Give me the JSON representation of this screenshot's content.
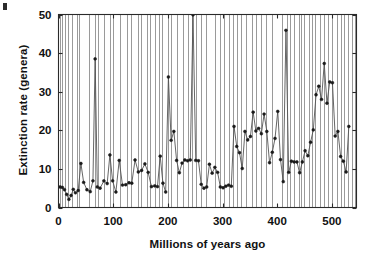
{
  "figure": {
    "ylabel": "Extinction rate (genera)",
    "xlabel": "Millions of years ago"
  },
  "chart_data": {
    "type": "line",
    "title": "",
    "xlabel": "Millions of years ago",
    "ylabel": "Extinction rate (genera)",
    "xlim": [
      0,
      545
    ],
    "ylim": [
      0,
      50
    ],
    "xticks": [
      0,
      100,
      200,
      300,
      400,
      500
    ],
    "xticklabels": [
      "0",
      "100",
      "200",
      "300",
      "400",
      "500"
    ],
    "yticks": [
      0,
      10,
      20,
      30,
      40,
      50
    ],
    "yticklabels": [
      "0",
      "10",
      "20",
      "30",
      "40",
      "50"
    ],
    "grid": "vertical-only",
    "grid_color": "#9a9a9a",
    "legend": "none",
    "marker": "dot",
    "marker_color": "#1a1a1a",
    "line_color": "#555555",
    "frame_color": "#2a2a2a",
    "x_increases_leftward": false,
    "note_offscale": "Permian-Triassic peak near 251 Ma extends to/through the top of the axis",
    "gridlines_x": [
      2,
      6,
      12,
      17,
      24,
      34,
      38,
      55,
      66,
      72,
      84,
      94,
      100,
      112,
      125,
      132,
      145,
      151,
      162,
      168,
      176,
      183,
      190,
      200,
      206,
      216,
      228,
      237,
      245,
      251,
      260,
      270,
      286,
      296,
      303,
      311,
      320,
      327,
      333,
      342,
      354,
      362,
      370,
      380,
      391,
      409,
      417,
      424,
      430,
      439,
      443,
      449,
      458,
      464,
      470,
      478,
      485,
      492,
      501,
      510,
      517,
      523,
      530,
      536,
      543
    ],
    "x": [
      3,
      7,
      11,
      15,
      19,
      23,
      27,
      31,
      36,
      41,
      46,
      52,
      58,
      63,
      67,
      71,
      76,
      83,
      89,
      94,
      99,
      105,
      111,
      117,
      123,
      129,
      134,
      140,
      146,
      152,
      158,
      164,
      170,
      176,
      181,
      186,
      191,
      196,
      201,
      206,
      211,
      216,
      221,
      226,
      231,
      236,
      241,
      246,
      251,
      256,
      261,
      266,
      271,
      276,
      281,
      286,
      291,
      296,
      301,
      306,
      311,
      316,
      321,
      326,
      331,
      336,
      341,
      346,
      351,
      356,
      361,
      366,
      371,
      376,
      381,
      386,
      391,
      396,
      401,
      406,
      411,
      416,
      421,
      426,
      431,
      436,
      441,
      446,
      451,
      456,
      461,
      466,
      471,
      476,
      481,
      486,
      491,
      496,
      501,
      506,
      511,
      516,
      521,
      526,
      531,
      536,
      541
    ],
    "y": [
      5.3,
      5.2,
      4.6,
      3.4,
      2.1,
      3.1,
      4.7,
      3.8,
      4.4,
      11.4,
      6.5,
      4.6,
      4.1,
      6.9,
      38.5,
      5.3,
      5.0,
      6.9,
      6.2,
      13.6,
      6.9,
      4.0,
      12.2,
      5.8,
      5.9,
      6.4,
      6.3,
      12.3,
      9.2,
      9.6,
      11.3,
      9.1,
      5.4,
      5.6,
      5.4,
      13.3,
      6.3,
      4.0,
      33.8,
      17.4,
      19.7,
      12.2,
      9.0,
      11.5,
      12.3,
      12.1,
      12.3,
      49.9,
      12.2,
      12.1,
      6.0,
      5.0,
      5.3,
      11.2,
      8.9,
      10.4,
      9.1,
      5.3,
      5.1,
      5.5,
      5.8,
      5.5,
      21.0,
      15.8,
      14.2,
      10.1,
      19.7,
      17.5,
      18.4,
      24.7,
      19.8,
      20.5,
      19.1,
      24.2,
      19.7,
      11.6,
      14.3,
      17.9,
      24.9,
      12.4,
      6.7,
      45.9,
      9.1,
      12.0,
      11.8,
      11.8,
      9.0,
      11.8,
      14.7,
      13.4,
      16.9,
      20.1,
      29.2,
      31.4,
      28.0,
      37.3,
      27.0,
      32.5,
      32.3,
      18.5,
      19.7,
      13.2,
      12.0,
      9.2,
      21.0
    ]
  }
}
